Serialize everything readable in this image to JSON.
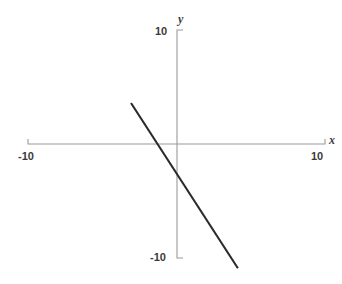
{
  "chart_data": {
    "type": "line",
    "title": "",
    "xlabel": "x",
    "ylabel": "y",
    "xlim": [
      -10,
      10
    ],
    "ylim": [
      -10,
      10
    ],
    "grid": false,
    "legend": false,
    "axis_style": "centered-cross",
    "x_tick_labels": [
      "-10",
      "10"
    ],
    "y_tick_labels": [
      "-10",
      "10"
    ],
    "series": [
      {
        "name": "line",
        "color": "#2a2a2a",
        "x": [
          -3.1,
          4.1
        ],
        "y": [
          3.6,
          -10.9
        ],
        "slope": -1.5,
        "y_intercept": -2.3,
        "x_intercept": -1.6
      }
    ],
    "annotations": []
  },
  "axes": {
    "x": {
      "name": "x",
      "min_label": "-10",
      "max_label": "10"
    },
    "y": {
      "name": "y",
      "min_label": "-10",
      "max_label": "10"
    },
    "color": "#9a9a9a"
  },
  "colors": {
    "background": "#ffffff",
    "axis": "#9a9a9a",
    "line": "#2a2a2a",
    "text": "#3a3a3a"
  }
}
